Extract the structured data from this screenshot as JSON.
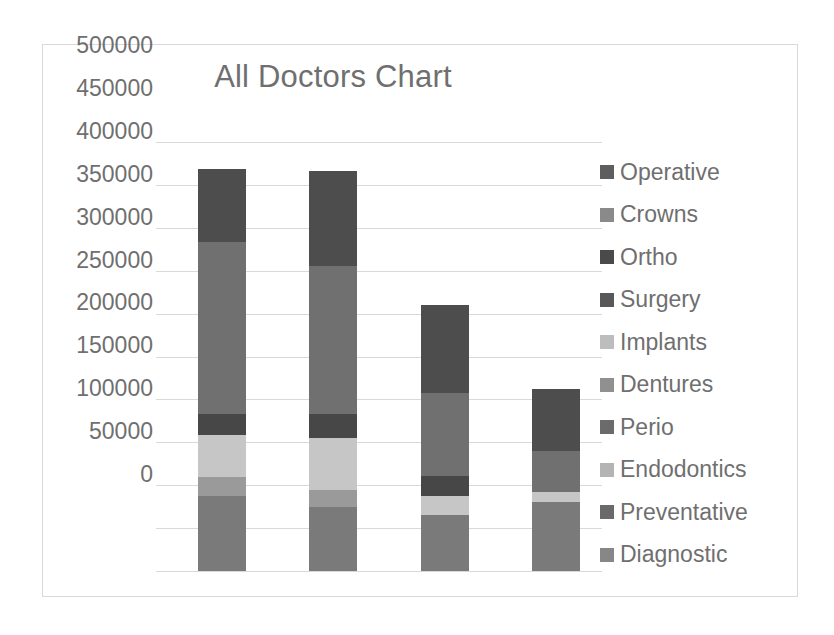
{
  "chart_data": {
    "type": "bar",
    "subtype": "stacked-column",
    "title": "All Doctors Chart",
    "xlabel": "",
    "ylabel": "",
    "ylim": [
      0,
      500000
    ],
    "ytick_step": 50000,
    "grid": true,
    "legend_position": "right",
    "categories": [
      "Doctor 1",
      "Doctor 2",
      "Doctor 3",
      "Doctor 4"
    ],
    "tick_labels": [
      "500000",
      "450000",
      "400000",
      "350000",
      "300000",
      "250000",
      "200000",
      "150000",
      "100000",
      "50000",
      "0"
    ],
    "tick_values": [
      500000,
      450000,
      400000,
      350000,
      300000,
      250000,
      200000,
      150000,
      100000,
      50000,
      0
    ],
    "stack_order_bottom_to_top": [
      "Diagnostic",
      "Preventative",
      "Endodontics",
      "Perio",
      "Dentures",
      "Implants",
      "Surgery",
      "Ortho",
      "Crowns",
      "Operative"
    ],
    "series": [
      {
        "name": "Operative",
        "color": "#595959",
        "values": [
          85000,
          110000,
          100000,
          72000
        ]
      },
      {
        "name": "Crowns",
        "color": "#808080",
        "values": [
          200000,
          195000,
          97000,
          48000
        ]
      },
      {
        "name": "Ortho",
        "color": "#404040",
        "values": [
          0,
          0,
          0,
          0
        ]
      },
      {
        "name": "Surgery",
        "color": "#474747",
        "values": [
          25000,
          28000,
          24000,
          0
        ]
      },
      {
        "name": "Implants",
        "color": "#bfbfbf",
        "values": [
          0,
          0,
          0,
          0
        ]
      },
      {
        "name": "Dentures",
        "color": "#a6a6a6",
        "values": [
          70000,
          68000,
          24000,
          12000
        ]
      },
      {
        "name": "Perio",
        "color": "#6e6e6e",
        "values": [
          0,
          0,
          0,
          0
        ]
      },
      {
        "name": "Endodontics",
        "color": "#c6c6c6",
        "values": [
          0,
          0,
          0,
          0
        ]
      },
      {
        "name": "Preventative",
        "color": "#555555",
        "values": [
          0,
          0,
          0,
          0
        ]
      },
      {
        "name": "Diagnostic",
        "color": "#7a7a7a",
        "values": [
          88000,
          75000,
          65000,
          80000
        ]
      }
    ],
    "bar_totals": [
      468000,
      466000,
      310000,
      212000
    ],
    "bars": [
      {
        "category": "Doctor 1",
        "total": 468000,
        "segments": [
          {
            "name": "Diagnostic",
            "value": 88000,
            "color": "#7a7a7a"
          },
          {
            "name": "Preventative",
            "value": 22000,
            "color": "#9a9a9a"
          },
          {
            "name": "Endodontics",
            "value": 48000,
            "color": "#c6c6c6"
          },
          {
            "name": "Surgery",
            "value": 25000,
            "color": "#474747"
          },
          {
            "name": "Crowns",
            "value": 200000,
            "color": "#707070"
          },
          {
            "name": "Operative",
            "value": 85000,
            "color": "#4d4d4d"
          }
        ]
      },
      {
        "category": "Doctor 2",
        "total": 466000,
        "segments": [
          {
            "name": "Diagnostic",
            "value": 75000,
            "color": "#7a7a7a"
          },
          {
            "name": "Preventative",
            "value": 20000,
            "color": "#9a9a9a"
          },
          {
            "name": "Endodontics",
            "value": 60000,
            "color": "#c6c6c6"
          },
          {
            "name": "Surgery",
            "value": 28000,
            "color": "#474747"
          },
          {
            "name": "Crowns",
            "value": 173000,
            "color": "#707070"
          },
          {
            "name": "Operative",
            "value": 110000,
            "color": "#4d4d4d"
          }
        ]
      },
      {
        "category": "Doctor 3",
        "total": 310000,
        "segments": [
          {
            "name": "Diagnostic",
            "value": 65000,
            "color": "#7a7a7a"
          },
          {
            "name": "Endodontics",
            "value": 22000,
            "color": "#c6c6c6"
          },
          {
            "name": "Surgery",
            "value": 24000,
            "color": "#474747"
          },
          {
            "name": "Crowns",
            "value": 97000,
            "color": "#707070"
          },
          {
            "name": "Operative",
            "value": 102000,
            "color": "#4d4d4d"
          }
        ]
      },
      {
        "category": "Doctor 4",
        "total": 212000,
        "segments": [
          {
            "name": "Diagnostic",
            "value": 80000,
            "color": "#7a7a7a"
          },
          {
            "name": "Endodontics",
            "value": 12000,
            "color": "#c6c6c6"
          },
          {
            "name": "Crowns",
            "value": 48000,
            "color": "#707070"
          },
          {
            "name": "Operative",
            "value": 72000,
            "color": "#4d4d4d"
          }
        ]
      }
    ],
    "legend": [
      {
        "label": "Operative",
        "color": "#5e5e5e"
      },
      {
        "label": "Crowns",
        "color": "#8a8a8a"
      },
      {
        "label": "Ortho",
        "color": "#4a4a4a"
      },
      {
        "label": "Surgery",
        "color": "#585858"
      },
      {
        "label": "Implants",
        "color": "#bdbdbd"
      },
      {
        "label": "Dentures",
        "color": "#909090"
      },
      {
        "label": "Perio",
        "color": "#6b6b6b"
      },
      {
        "label": "Endodontics",
        "color": "#b4b4b4"
      },
      {
        "label": "Preventative",
        "color": "#6a6a6a"
      },
      {
        "label": "Diagnostic",
        "color": "#878787"
      }
    ]
  },
  "style": {
    "text_color": "#6f6f6f",
    "gridline_color": "#d9d9d9",
    "border_color": "#d9d9d9",
    "background": "#ffffff"
  }
}
